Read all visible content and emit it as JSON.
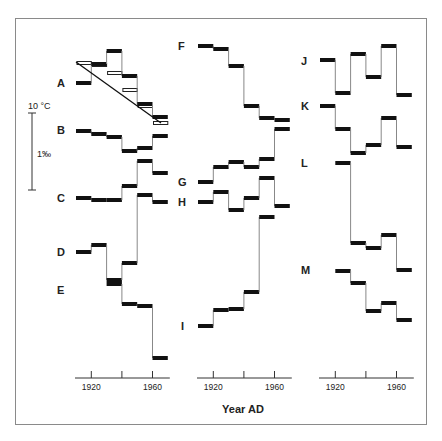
{
  "chart_data": {
    "type": "line",
    "subtype": "step (decadal means), 13 stacked series in 3 columns",
    "title": "",
    "xlabel": "Year AD",
    "ylabel": "",
    "scale_bar": {
      "top_label": "10 °C",
      "mid_label": "1‰",
      "note": "vertical scale bar: 1‰ ≈ 10 °C"
    },
    "x": [
      "1910",
      "1920",
      "1930",
      "1940",
      "1950",
      "1960"
    ],
    "x_ticks": [
      "1920",
      "1940",
      "1960"
    ],
    "x_tick_labels": [
      "1920",
      "",
      "1960"
    ],
    "grid": false,
    "legend": "none (series labeled A–M at left)",
    "columns": [
      {
        "x0": 76,
        "decade_px": 15.3,
        "axis_y": 378,
        "series": [
          "A",
          "B",
          "C",
          "D",
          "E"
        ]
      },
      {
        "x0": 198,
        "decade_px": 15.3,
        "axis_y": 378,
        "series": [
          "F",
          "G",
          "H",
          "I"
        ]
      },
      {
        "x0": 320,
        "decade_px": 15.3,
        "axis_y": 378,
        "series": [
          "J",
          "K",
          "L",
          "M"
        ]
      }
    ],
    "series": [
      {
        "name": "A",
        "label_pos": [
          57,
          87
        ],
        "col": 0,
        "values_px": [
          83,
          64,
          51,
          76,
          104,
          117
        ],
        "open_values_px": [
          63,
          65,
          73,
          90,
          106,
          123
        ],
        "trend_px": [
          [
            76,
            62
          ],
          [
            161,
            123
          ]
        ]
      },
      {
        "name": "B",
        "label_pos": [
          57,
          134
        ],
        "col": 0,
        "values_px": [
          131,
          134,
          137,
          151,
          148,
          136
        ]
      },
      {
        "name": "C",
        "label_pos": [
          57,
          202
        ],
        "col": 0,
        "values_px": [
          198,
          200,
          200,
          186,
          161,
          173
        ]
      },
      {
        "name": "D",
        "label_pos": [
          57,
          256
        ],
        "col": 0,
        "values_px": [
          252,
          245,
          280,
          263,
          195,
          202
        ]
      },
      {
        "name": "E",
        "label_pos": [
          57,
          294
        ],
        "col": 0,
        "start": 2,
        "values_px": [
          284,
          304,
          306,
          358
        ]
      },
      {
        "name": "F",
        "label_pos": [
          178,
          50
        ],
        "col": 1,
        "values_px": [
          46,
          49,
          66,
          106,
          118,
          120
        ]
      },
      {
        "name": "G",
        "label_pos": [
          178,
          186
        ],
        "col": 1,
        "values_px": [
          182,
          167,
          162,
          167,
          159,
          129
        ]
      },
      {
        "name": "H",
        "label_pos": [
          178,
          206
        ],
        "col": 1,
        "values_px": [
          202,
          192,
          210,
          198,
          178,
          206
        ]
      },
      {
        "name": "I",
        "label_pos": [
          181,
          330
        ],
        "col": 1,
        "values_px": [
          326,
          310,
          309,
          292,
          217
        ]
      },
      {
        "name": "J",
        "label_pos": [
          301,
          65
        ],
        "col": 2,
        "values_px": [
          60,
          93,
          54,
          77,
          46,
          95
        ]
      },
      {
        "name": "K",
        "label_pos": [
          301,
          110
        ],
        "col": 2,
        "values_px": [
          106,
          129,
          153,
          145,
          118,
          147
        ]
      },
      {
        "name": "L",
        "label_pos": [
          301,
          167
        ],
        "col": 2,
        "start": 1,
        "values_px": [
          163,
          243,
          248,
          235,
          270
        ]
      },
      {
        "name": "M",
        "label_pos": [
          301,
          274
        ],
        "col": 2,
        "start": 1,
        "values_px": [
          271,
          283,
          311,
          303,
          320
        ]
      }
    ]
  },
  "labels": {
    "xlabel": "Year AD",
    "scale_top": "10 °C",
    "scale_mid": "1‰"
  }
}
